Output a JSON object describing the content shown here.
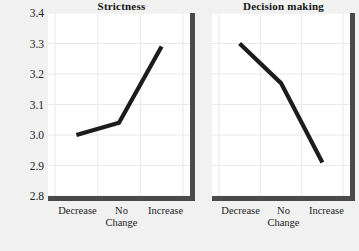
{
  "chart_data": {
    "type": "line",
    "title": "",
    "xlabel": "Change",
    "ylabel": "Peer orientation",
    "categories": [
      "Decrease",
      "No",
      "Increase"
    ],
    "category_second_line": "Change",
    "ylim": [
      2.8,
      3.4
    ],
    "yticks": [
      "2.8",
      "2.9",
      "3.0",
      "3.1",
      "3.2",
      "3.3",
      "3.4"
    ],
    "ytick_values": [
      2.8,
      2.9,
      3.0,
      3.1,
      3.2,
      3.3,
      3.4
    ],
    "grid": true,
    "legend": "none",
    "panels": [
      {
        "title": "Strictness",
        "series": [
          {
            "name": "Peer orientation",
            "values": [
              3.0,
              3.04,
              3.29
            ]
          }
        ]
      },
      {
        "title": "Decision making",
        "series": [
          {
            "name": "Peer orientation",
            "values": [
              3.3,
              3.17,
              2.91
            ]
          }
        ]
      }
    ],
    "colors": {
      "line": "#1c1c1c",
      "axis": "#4a4a4a",
      "grid": "#e9e9e9",
      "plot_background": "#ffffff",
      "figure_background": "#f1f1f1",
      "text": "#242424"
    }
  }
}
